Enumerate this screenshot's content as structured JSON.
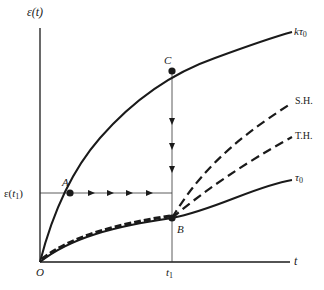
{
  "diagram": {
    "axes": {
      "y_label": "ε(t)",
      "x_label": "t",
      "origin_label": "O",
      "x_tick_label": "t1",
      "y_tick_label": "ε(t1)"
    },
    "curves": {
      "upper": {
        "label": "kτ0",
        "stress": "kτ0"
      },
      "lower": {
        "label": "τ0",
        "stress": "τ0"
      },
      "strain_hardening": {
        "label": "S.H."
      },
      "time_hardening": {
        "label": "T.H."
      }
    },
    "points": {
      "A": "A",
      "B": "B",
      "C": "C"
    },
    "colors": {
      "ink": "#1a1a1a",
      "thin_line": "#333333",
      "background": "#ffffff"
    }
  }
}
